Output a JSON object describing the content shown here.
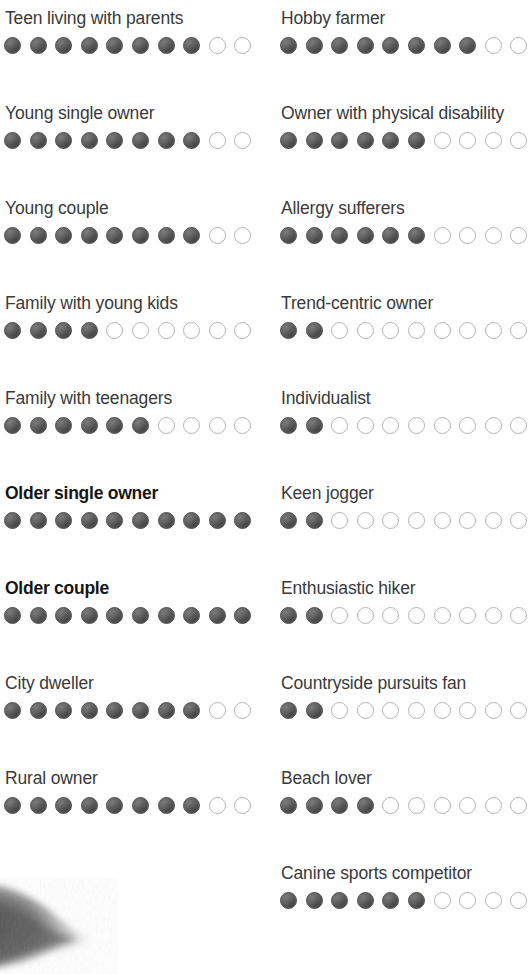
{
  "meta": {
    "scale_max": 10,
    "filled_color": "#5b5b5b",
    "empty_color": "#ffffff",
    "empty_border_color": "#b4b4b4",
    "text_color": "#3a3a3a",
    "highlight_text_color": "#161616"
  },
  "artifact": {
    "name": "dog-fur-photo-fragment",
    "description": "grayscale photographic fragment"
  },
  "chart_data": {
    "type": "bar",
    "title": "",
    "subtitle": "",
    "xlabel": "",
    "ylabel": "",
    "ylim": [
      0,
      10
    ],
    "grid": false,
    "legend": "none",
    "categories": [
      "Teen living with parents",
      "Young single owner",
      "Young couple",
      "Family with young kids",
      "Family with teenagers",
      "Older single owner",
      "Older couple",
      "City dweller",
      "Rural owner",
      "Hobby farmer",
      "Owner with physical disability",
      "Allergy sufferers",
      "Trend-centric owner",
      "Individualist",
      "Keen jogger",
      "Enthusiastic hiker",
      "Countryside pursuits fan",
      "Beach lover",
      "Canine sports competitor"
    ],
    "values": [
      8,
      8,
      8,
      4,
      6,
      10,
      10,
      8,
      8,
      8,
      6,
      6,
      2,
      2,
      2,
      2,
      2,
      4,
      6
    ]
  },
  "columns": {
    "left": {
      "name": "left-column",
      "rows": [
        {
          "label": "Teen living with parents",
          "filled": 8,
          "empty": 2,
          "bold": false
        },
        {
          "label": "Young single owner",
          "filled": 8,
          "empty": 2,
          "bold": false
        },
        {
          "label": "Young couple",
          "filled": 8,
          "empty": 2,
          "bold": false
        },
        {
          "label": "Family with young kids",
          "filled": 4,
          "empty": 6,
          "bold": false
        },
        {
          "label": "Family with teenagers",
          "filled": 6,
          "empty": 4,
          "bold": false
        },
        {
          "label": "Older single owner",
          "filled": 10,
          "empty": 0,
          "bold": true
        },
        {
          "label": "Older couple",
          "filled": 10,
          "empty": 0,
          "bold": true
        },
        {
          "label": "City dweller",
          "filled": 8,
          "empty": 2,
          "bold": false
        },
        {
          "label": "Rural owner",
          "filled": 8,
          "empty": 2,
          "bold": false
        }
      ]
    },
    "right": {
      "name": "right-column",
      "rows": [
        {
          "label": "Hobby farmer",
          "filled": 8,
          "empty": 2,
          "bold": false
        },
        {
          "label": "Owner with physical disability",
          "filled": 6,
          "empty": 4,
          "bold": false
        },
        {
          "label": "Allergy sufferers",
          "filled": 6,
          "empty": 4,
          "bold": false
        },
        {
          "label": "Trend-centric owner",
          "filled": 2,
          "empty": 8,
          "bold": false
        },
        {
          "label": "Individualist",
          "filled": 2,
          "empty": 8,
          "bold": false
        },
        {
          "label": "Keen jogger",
          "filled": 2,
          "empty": 8,
          "bold": false
        },
        {
          "label": "Enthusiastic hiker",
          "filled": 2,
          "empty": 8,
          "bold": false
        },
        {
          "label": "Countryside pursuits fan",
          "filled": 2,
          "empty": 8,
          "bold": false
        },
        {
          "label": "Beach lover",
          "filled": 4,
          "empty": 6,
          "bold": false
        },
        {
          "label": "Canine sports competitor",
          "filled": 6,
          "empty": 4,
          "bold": false
        }
      ]
    }
  }
}
